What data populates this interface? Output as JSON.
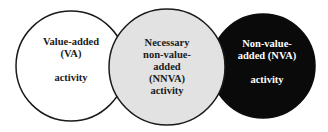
{
  "diagram": {
    "type": "venn",
    "circles": [
      {
        "id": "va",
        "lines": [
          "Value-added",
          "(VA)",
          "",
          "activity"
        ],
        "fill": "#ffffff",
        "text_color": "#1a1a1a"
      },
      {
        "id": "nnva",
        "lines": [
          "Necessary",
          "non-value-",
          "added",
          "(NNVA)",
          "activity"
        ],
        "fill": "#e2e2e2",
        "text_color": "#1a1a1a"
      },
      {
        "id": "nva",
        "lines": [
          "Non-value-",
          "added (NVA)",
          "",
          "activity"
        ],
        "fill": "#0a0a0a",
        "text_color": "#ffffff"
      }
    ]
  }
}
